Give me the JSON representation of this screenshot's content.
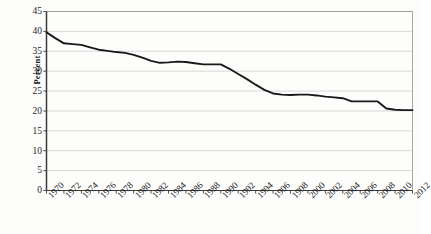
{
  "chart_data": {
    "type": "line",
    "title": "",
    "subtitle": "",
    "xlabel": "",
    "ylabel": "Percent",
    "xlim": [
      1970,
      2012
    ],
    "ylim": [
      0,
      45
    ],
    "y_ticks": [
      0,
      5,
      10,
      15,
      20,
      25,
      30,
      35,
      40,
      45
    ],
    "x_ticks": [
      1970,
      1972,
      1974,
      1976,
      1978,
      1980,
      1982,
      1984,
      1986,
      1988,
      1990,
      1992,
      1994,
      1996,
      1998,
      2000,
      2002,
      2004,
      2006,
      2008,
      2010,
      2012
    ],
    "x_tick_labels": [
      "1970",
      "1972",
      "1974",
      "1976",
      "1978",
      "1980",
      "1982",
      "1984",
      "1986",
      "1988",
      "1990",
      "1992",
      "1994",
      "1996",
      "1998",
      "2000",
      "2002",
      "2004",
      "2006",
      "2008",
      "2010",
      "2012"
    ],
    "y_tick_labels": [
      "0",
      "5",
      "10",
      "15",
      "20",
      "25",
      "30",
      "35",
      "40",
      "45"
    ],
    "grid": "horizontal",
    "legend": "none",
    "line_color": "#1a1a1a",
    "line_width": 1.9,
    "x": [
      1970,
      1971,
      1972,
      1973,
      1974,
      1975,
      1976,
      1977,
      1978,
      1979,
      1980,
      1981,
      1982,
      1983,
      1984,
      1985,
      1986,
      1987,
      1988,
      1989,
      1990,
      1991,
      1992,
      1993,
      1994,
      1995,
      1996,
      1997,
      1998,
      1999,
      2000,
      2001,
      2002,
      2003,
      2004,
      2005,
      2006,
      2007,
      2008,
      2009,
      2010,
      2011,
      2012
    ],
    "values": [
      39.8,
      38.3,
      37.0,
      36.8,
      36.6,
      36.0,
      35.4,
      35.1,
      34.8,
      34.6,
      34.1,
      33.4,
      32.6,
      32.1,
      32.2,
      32.4,
      32.3,
      32.0,
      31.7,
      31.7,
      31.7,
      30.6,
      29.3,
      28.0,
      26.6,
      25.3,
      24.4,
      24.1,
      24.0,
      24.1,
      24.1,
      23.9,
      23.6,
      23.4,
      23.2,
      22.4,
      22.4,
      22.4,
      22.4,
      20.6,
      20.3,
      20.2,
      20.2
    ],
    "series": [
      {
        "name": "Percent",
        "values": [
          39.8,
          38.3,
          37.0,
          36.8,
          36.6,
          36.0,
          35.4,
          35.1,
          34.8,
          34.6,
          34.1,
          33.4,
          32.6,
          32.1,
          32.2,
          32.4,
          32.3,
          32.0,
          31.7,
          31.7,
          31.7,
          30.6,
          29.3,
          28.0,
          26.6,
          25.3,
          24.4,
          24.1,
          24.0,
          24.1,
          24.1,
          23.9,
          23.6,
          23.4,
          23.2,
          22.4,
          22.4,
          22.4,
          22.4,
          20.6,
          20.3,
          20.2,
          20.2
        ]
      }
    ]
  }
}
